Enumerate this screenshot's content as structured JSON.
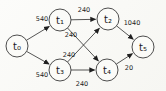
{
  "diagram": {
    "type": "directed-graph",
    "colors": {
      "background": "#fbfbf8",
      "stroke": "#2b2b2b",
      "text": "#1b1b1b"
    },
    "nodes": [
      {
        "id": "t0",
        "label": "t₀"
      },
      {
        "id": "t1",
        "label": "t₁"
      },
      {
        "id": "t2",
        "label": "t₂"
      },
      {
        "id": "t3",
        "label": "t₃"
      },
      {
        "id": "t4",
        "label": "t₄"
      },
      {
        "id": "t5",
        "label": "t₅"
      }
    ],
    "edges": [
      {
        "from": "t0",
        "to": "t1",
        "weight": "540"
      },
      {
        "from": "t0",
        "to": "t3",
        "weight": "540"
      },
      {
        "from": "t1",
        "to": "t2",
        "weight": "240"
      },
      {
        "from": "t1",
        "to": "t4",
        "weight": "240"
      },
      {
        "from": "t3",
        "to": "t2",
        "weight": "240"
      },
      {
        "from": "t3",
        "to": "t4",
        "weight": "240"
      },
      {
        "from": "t2",
        "to": "t5",
        "weight": "1040"
      },
      {
        "from": "t4",
        "to": "t5",
        "weight": "20"
      }
    ]
  }
}
